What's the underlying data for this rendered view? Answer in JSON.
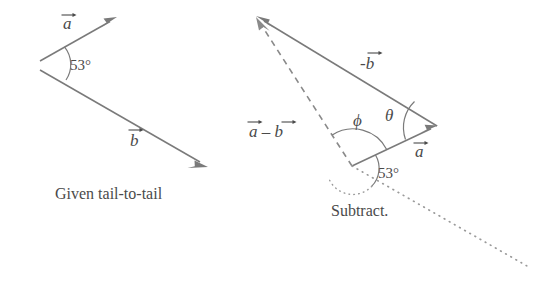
{
  "figure": {
    "type": "vector-subtraction-diagram",
    "background_color": "#ffffff",
    "line_color": "#7a7a7a",
    "text_color": "#4a4a4a"
  },
  "left_panel": {
    "caption": "Given tail-to-tail",
    "angle_label": "53°",
    "vectors": [
      {
        "name": "a",
        "label": "a",
        "has_overbar": true,
        "tail": [
          40,
          61
        ],
        "tip": [
          116,
          18
        ]
      },
      {
        "name": "b",
        "label": "b",
        "has_overbar": true,
        "tail": [
          40,
          70
        ],
        "tip": [
          207,
          166
        ]
      }
    ],
    "labels": {
      "a": "a",
      "b": "b"
    }
  },
  "right_panel": {
    "caption": "Subtract.",
    "angle_label_deg": "53°",
    "angle_label_phi": "ϕ",
    "angle_label_theta": "θ",
    "vectors": [
      {
        "name": "minus-b",
        "label": "-b",
        "has_overbar": true,
        "tail": [
          437,
          126
        ],
        "tip": [
          257,
          17
        ]
      },
      {
        "name": "a",
        "label": "a",
        "has_overbar": true,
        "tail": [
          352,
          166
        ],
        "tip": [
          437,
          126
        ]
      },
      {
        "name": "a-minus-b",
        "label": "a - b",
        "has_overbar": true,
        "tail": [
          352,
          166
        ],
        "tip": [
          257,
          19
        ],
        "style": "dashed"
      }
    ],
    "reference_line": {
      "name": "b-direction-dotted",
      "from": [
        352,
        166
      ],
      "to": [
        527,
        266
      ],
      "style": "dotted"
    },
    "labels": {
      "minus_b": "-b",
      "a": "a",
      "a_minus_b": "a – b"
    }
  }
}
